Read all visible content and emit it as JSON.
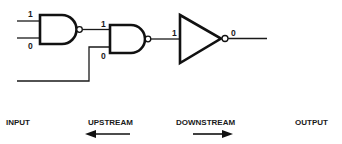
{
  "diagram": {
    "gates": [
      {
        "id": "nand-1",
        "type": "NAND",
        "inputs": [
          "1",
          "0"
        ]
      },
      {
        "id": "nand-2",
        "type": "NAND",
        "inputs": [
          "1",
          "0"
        ]
      },
      {
        "id": "inverter",
        "type": "NOT",
        "input": "1",
        "output": "0"
      }
    ],
    "labels": {
      "g1_in_top": "1",
      "g1_in_bottom": "0",
      "g2_in_top": "1",
      "g2_in_bottom": "0",
      "inv_in": "1",
      "inv_out": "0"
    },
    "legend": {
      "input": "INPUT",
      "upstream": "UPSTREAM",
      "downstream": "DOWNSTREAM",
      "output": "OUTPUT"
    },
    "colors": {
      "ink": "#111111",
      "background": "#ffffff"
    }
  }
}
